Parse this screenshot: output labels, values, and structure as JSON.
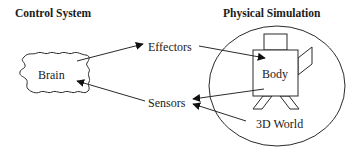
{
  "diagram": {
    "titles": {
      "control_system": "Control System",
      "physical_simulation": "Physical Simulation"
    },
    "nodes": {
      "brain": "Brain",
      "effectors": "Effectors",
      "sensors": "Sensors",
      "body": "Body",
      "world": "3D World"
    },
    "edges": [
      {
        "from": "Brain",
        "to": "Effectors"
      },
      {
        "from": "Effectors",
        "to": "Body"
      },
      {
        "from": "Body",
        "to": "Sensors"
      },
      {
        "from": "3D World",
        "to": "Sensors"
      },
      {
        "from": "Sensors",
        "to": "Brain"
      }
    ]
  }
}
